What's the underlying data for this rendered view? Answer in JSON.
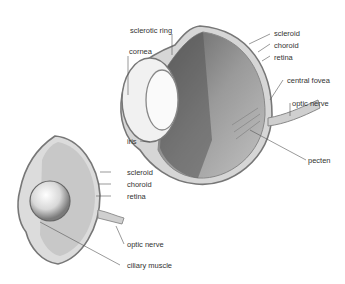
{
  "colors": {
    "outline": "#777777",
    "sclera": "#d9d9d9",
    "interior": "#b5b5b5",
    "dark": "#6a6a6a",
    "text": "#333333"
  },
  "eye_large": {
    "labels": {
      "sclerotic_ring": "sclerotic ring",
      "cornea": "cornea",
      "iris": "iris",
      "scleroid": "scleroid",
      "choroid": "choroid",
      "retina": "retina",
      "central_fovea": "central fovea",
      "optic_nerve": "optic nerve",
      "pecten": "pecten"
    }
  },
  "eye_small": {
    "labels": {
      "scleroid": "scleroid",
      "choroid": "choroid",
      "retina": "retina",
      "optic_nerve": "optic nerve",
      "ciliary_muscle": "ciliary muscle"
    }
  }
}
